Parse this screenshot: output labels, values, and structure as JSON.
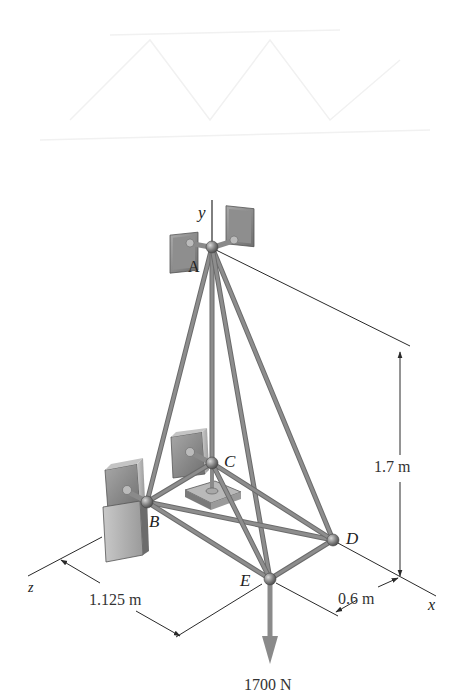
{
  "figure": {
    "type": "3D space truss (statics problem figure)",
    "axes": {
      "y": {
        "label": "y"
      },
      "x": {
        "label": "x"
      },
      "z": {
        "label": "z"
      }
    },
    "joints": [
      {
        "id": "A",
        "label": "A",
        "x": 212,
        "y": 247,
        "support": "ball-and-socket (twin wall brackets)"
      },
      {
        "id": "B",
        "label": "B",
        "x": 147,
        "y": 502,
        "support": "wall bracket"
      },
      {
        "id": "C",
        "label": "C",
        "x": 212,
        "y": 463,
        "support": "wall bracket + floor plate"
      },
      {
        "id": "D",
        "label": "D",
        "x": 333,
        "y": 540,
        "support": "none"
      },
      {
        "id": "E",
        "label": "E",
        "x": 270,
        "y": 579,
        "support": "none"
      }
    ],
    "members": [
      [
        "A",
        "B"
      ],
      [
        "A",
        "C"
      ],
      [
        "A",
        "D"
      ],
      [
        "A",
        "E"
      ],
      [
        "B",
        "C"
      ],
      [
        "B",
        "D"
      ],
      [
        "B",
        "E"
      ],
      [
        "C",
        "D"
      ],
      [
        "C",
        "E"
      ],
      [
        "D",
        "E"
      ]
    ],
    "dimensions": {
      "height": "1.7 m",
      "width_z": "1.125 m",
      "depth_x": "0.6 m"
    },
    "load": {
      "label": "1700 N",
      "at": "E",
      "direction": "down",
      "color": "#8a8a8a"
    },
    "colors": {
      "member": "#8d8d8d",
      "member_edge": "#6b6b6b",
      "bracket": "#7a7a7a",
      "line": "#2a2a2a"
    }
  }
}
